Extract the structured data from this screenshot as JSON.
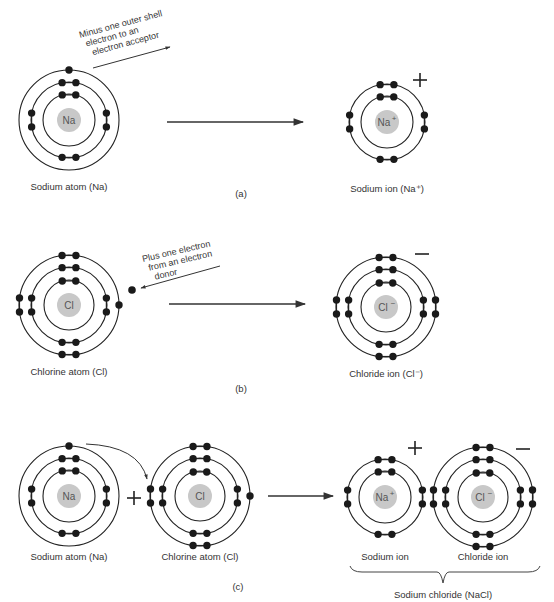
{
  "diagram": {
    "colors": {
      "ring": "#222222",
      "electron": "#1a1a1a",
      "nucleus": "#c8c8c8",
      "text": "#333333"
    },
    "panels": [
      {
        "id": "a",
        "caption": "(a)",
        "caption_pos": [
          241,
          197
        ],
        "arrow": {
          "x1": 167,
          "y1": 122,
          "x2": 303,
          "y2": 122
        },
        "annotation": {
          "lines": [
            "Minus one outer shell",
            "electron to an",
            "electron acceptor"
          ],
          "x": 80,
          "y": 38,
          "rotate": -15,
          "arrow": {
            "x1": 93,
            "y1": 68,
            "x2": 170,
            "y2": 47
          }
        },
        "left": {
          "label": "Sodium atom (Na)",
          "symbol": "Na",
          "sup": "",
          "cx": 69,
          "cy": 120,
          "rings": [
            26,
            38,
            50
          ],
          "electrons": "na_atom"
        },
        "right": {
          "label": "Sodium ion (Na⁺)",
          "symbol": "Na",
          "sup": "+",
          "cx": 387,
          "cy": 122,
          "rings": [
            26,
            38
          ],
          "electrons": "na_ion",
          "charge": "+",
          "charge_pos": [
            420,
            80
          ]
        }
      },
      {
        "id": "b",
        "caption": "(b)",
        "caption_pos": [
          241,
          392
        ],
        "arrow": {
          "x1": 169,
          "y1": 304,
          "x2": 305,
          "y2": 304
        },
        "annotation": {
          "lines": [
            "Plus one electron",
            "from an electron",
            "donor"
          ],
          "x": 143,
          "y": 262,
          "rotate": -13,
          "arrow": {
            "x1": 220,
            "y1": 266,
            "x2": 141,
            "y2": 288
          }
        },
        "free_electron": {
          "cx": 132,
          "cy": 290
        },
        "left": {
          "label": "Chlorine atom (Cl)",
          "symbol": "Cl",
          "sup": "",
          "cx": 69,
          "cy": 305,
          "rings": [
            25,
            38,
            50
          ],
          "electrons": "cl_atom"
        },
        "right": {
          "label": "Chloride ion (Cl⁻)",
          "symbol": "Cl",
          "sup": "−",
          "cx": 386,
          "cy": 307,
          "rings": [
            25,
            38,
            50
          ],
          "electrons": "cl_ion",
          "charge": "−",
          "charge_pos": [
            422,
            254
          ]
        }
      },
      {
        "id": "c",
        "caption": "(c)",
        "caption_pos": [
          238,
          590
        ],
        "arrow": {
          "x1": 268,
          "y1": 496,
          "x2": 333,
          "y2": 496
        },
        "plus_between": {
          "text": "+",
          "x": 134,
          "y": 498
        },
        "transfer_arrow": {
          "from": [
            86,
            444
          ],
          "to": [
            147,
            479
          ]
        },
        "atoms": [
          {
            "label": "Sodium atom (Na)",
            "symbol": "Na",
            "sup": "",
            "cx": 69,
            "cy": 496,
            "rings": [
              26,
              38,
              50
            ],
            "electrons": "na_atom"
          },
          {
            "label": "Chlorine atom (Cl)",
            "symbol": "Cl",
            "sup": "",
            "cx": 200,
            "cy": 496,
            "rings": [
              25,
              38,
              50
            ],
            "electrons": "cl_atom"
          },
          {
            "label": "Sodium ion",
            "symbol": "Na",
            "sup": "+",
            "cx": 385,
            "cy": 497,
            "rings": [
              26,
              38
            ],
            "electrons": "na_ion",
            "charge": "+",
            "charge_pos": [
              415,
              448
            ]
          },
          {
            "label": "Chloride ion",
            "symbol": "Cl",
            "sup": "−",
            "cx": 483,
            "cy": 497,
            "rings": [
              25,
              38,
              50
            ],
            "electrons": "cl_ion",
            "charge": "−",
            "charge_pos": [
              523,
              449
            ]
          }
        ],
        "brace": {
          "x1": 350,
          "x2": 540,
          "y": 572,
          "tip_x": 443,
          "tip_y": 583
        },
        "group_label": "Sodium chloride (NaCl)",
        "group_label_pos": [
          443,
          598
        ]
      }
    ]
  }
}
